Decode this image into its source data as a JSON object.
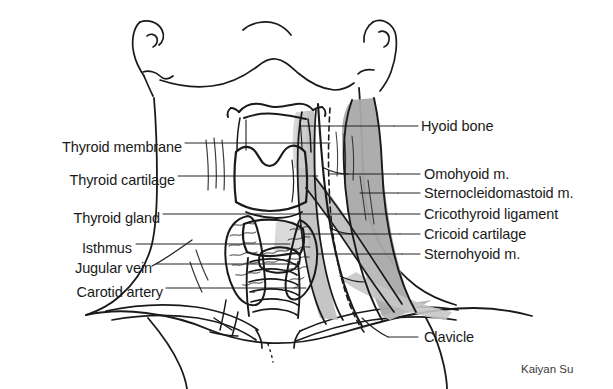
{
  "figure": {
    "credit": "Kaiyan Su",
    "background_color": "#ffffff",
    "ink_color": "#1a1a1a",
    "shade_light": "#cfcfcf",
    "shade_mid": "#b4b4b4",
    "shade_dark": "#9c9c9c"
  },
  "labels_left": [
    {
      "id": "thyroid-membrane",
      "text": "Thyroid membrane",
      "x": 182,
      "y": 147,
      "leader_x2": 330,
      "leader_y2": 147
    },
    {
      "id": "thyroid-cartilage",
      "text": "Thyroid cartilage",
      "x": 175,
      "y": 180,
      "leader_x2": 318,
      "leader_y2": 180
    },
    {
      "id": "thyroid-gland",
      "text": "Thyroid gland",
      "x": 160,
      "y": 218,
      "leader_x2": 300,
      "leader_y2": 218
    },
    {
      "id": "isthmus",
      "text": "Isthmus",
      "x": 132,
      "y": 248,
      "leader_x2": 290,
      "leader_y2": 248
    },
    {
      "id": "jugular-vein",
      "text": "Jugular vein",
      "x": 152,
      "y": 268,
      "leader_x2": 298,
      "leader_y2": 268
    },
    {
      "id": "carotid-artery",
      "text": "Carotid artery",
      "x": 163,
      "y": 292,
      "leader_x2": 305,
      "leader_y2": 292
    }
  ],
  "labels_right": [
    {
      "id": "hyoid-bone",
      "text": "Hyoid bone",
      "x": 421,
      "y": 130,
      "leader_x1": 394,
      "leader_y1": 130
    },
    {
      "id": "omohyoid-m",
      "text": "Omohyoid m.",
      "x": 424,
      "y": 178,
      "leader_x1": 398,
      "leader_y1": 178
    },
    {
      "id": "sternocleidomastoid-m",
      "text": "Sternocleidomastoid m.",
      "x": 424,
      "y": 197,
      "leader_x1": 398,
      "leader_y1": 197
    },
    {
      "id": "cricothyroid-ligament",
      "text": "Cricothyroid ligament",
      "x": 424,
      "y": 218,
      "leader_x1": 396,
      "leader_y1": 218
    },
    {
      "id": "cricoid-cartilage",
      "text": "Cricoid cartilage",
      "x": 424,
      "y": 238,
      "leader_x1": 400,
      "leader_y1": 238
    },
    {
      "id": "sternohyoid-m",
      "text": "Sternohyoid m.",
      "x": 424,
      "y": 258,
      "leader_x1": 402,
      "leader_y1": 258
    },
    {
      "id": "clavicle",
      "text": "Clavicle",
      "x": 424,
      "y": 341,
      "leader_x1": 388,
      "leader_y1": 341
    }
  ]
}
